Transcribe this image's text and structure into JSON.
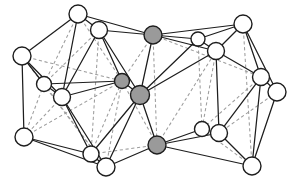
{
  "figure": {
    "kind": "node-link-diagram",
    "background_color": "#ffffff",
    "edge_solid_color": "#1d1d1d",
    "edge_dashed_color": "#9d9d9d",
    "node_white_fill": "#ffffff",
    "node_gray_fill": "#9a9a9a",
    "node_outline_color": "#1d1d1d",
    "node_count": 22,
    "gray_node_count": 4,
    "white_node_count": 18
  },
  "nodes": [
    {
      "id": "n1",
      "label": "",
      "x": 78,
      "y": 14,
      "r": 9.0,
      "fill": "white",
      "group": "left-cluster"
    },
    {
      "id": "n2",
      "label": "",
      "x": 99,
      "y": 30,
      "r": 8.5,
      "fill": "white",
      "group": "left-cluster"
    },
    {
      "id": "n3",
      "label": "",
      "x": 22,
      "y": 56,
      "r": 9.0,
      "fill": "white",
      "group": "left-cluster"
    },
    {
      "id": "n4",
      "label": "",
      "x": 44,
      "y": 84,
      "r": 7.5,
      "fill": "white",
      "group": "left-cluster"
    },
    {
      "id": "n5",
      "label": "",
      "x": 62,
      "y": 97,
      "r": 8.5,
      "fill": "white",
      "group": "left-cluster"
    },
    {
      "id": "n6",
      "label": "",
      "x": 24,
      "y": 137,
      "r": 9.0,
      "fill": "white",
      "group": "left-cluster"
    },
    {
      "id": "n7",
      "label": "",
      "x": 91,
      "y": 154,
      "r": 8.0,
      "fill": "white",
      "group": "left-cluster"
    },
    {
      "id": "n8",
      "label": "",
      "x": 106,
      "y": 167,
      "r": 9.0,
      "fill": "white",
      "group": "left-cluster"
    },
    {
      "id": "n9",
      "label": "",
      "x": 122,
      "y": 81,
      "r": 7.5,
      "fill": "gray",
      "group": "core"
    },
    {
      "id": "n10",
      "label": "",
      "x": 140,
      "y": 95,
      "r": 9.5,
      "fill": "gray",
      "group": "core"
    },
    {
      "id": "n11",
      "label": "",
      "x": 153,
      "y": 35,
      "r": 9.0,
      "fill": "gray",
      "group": "core"
    },
    {
      "id": "n12",
      "label": "",
      "x": 157,
      "y": 145,
      "r": 9.0,
      "fill": "gray",
      "group": "core"
    },
    {
      "id": "n13",
      "label": "",
      "x": 198,
      "y": 39,
      "r": 7.0,
      "fill": "white",
      "group": "right-cluster"
    },
    {
      "id": "n14",
      "label": "",
      "x": 216,
      "y": 51,
      "r": 8.5,
      "fill": "white",
      "group": "right-cluster"
    },
    {
      "id": "n15",
      "label": "",
      "x": 243,
      "y": 24,
      "r": 9.0,
      "fill": "white",
      "group": "right-cluster"
    },
    {
      "id": "n16",
      "label": "",
      "x": 261,
      "y": 77,
      "r": 8.5,
      "fill": "white",
      "group": "right-cluster"
    },
    {
      "id": "n17",
      "label": "",
      "x": 277,
      "y": 92,
      "r": 9.0,
      "fill": "white",
      "group": "right-cluster"
    },
    {
      "id": "n18",
      "label": "",
      "x": 202,
      "y": 129,
      "r": 7.5,
      "fill": "white",
      "group": "right-cluster"
    },
    {
      "id": "n19",
      "label": "",
      "x": 219,
      "y": 133,
      "r": 8.5,
      "fill": "white",
      "group": "right-cluster"
    },
    {
      "id": "n20",
      "label": "",
      "x": 252,
      "y": 166,
      "r": 9.0,
      "fill": "white",
      "group": "right-cluster"
    },
    {
      "id": "n21",
      "label": "",
      "x": 129,
      "y": 157,
      "r": 0.0,
      "fill": "white",
      "group": "hidden-helper"
    },
    {
      "id": "n22",
      "label": "",
      "x": 188,
      "y": 112,
      "r": 0.0,
      "fill": "white",
      "group": "hidden-helper"
    }
  ],
  "edges_solid": [
    [
      "n1",
      "n2"
    ],
    [
      "n1",
      "n3"
    ],
    [
      "n1",
      "n5"
    ],
    [
      "n1",
      "n11"
    ],
    [
      "n2",
      "n11"
    ],
    [
      "n2",
      "n5"
    ],
    [
      "n2",
      "n9"
    ],
    [
      "n2",
      "n10"
    ],
    [
      "n3",
      "n4"
    ],
    [
      "n3",
      "n5"
    ],
    [
      "n3",
      "n6"
    ],
    [
      "n4",
      "n5"
    ],
    [
      "n4",
      "n9"
    ],
    [
      "n5",
      "n9"
    ],
    [
      "n5",
      "n8"
    ],
    [
      "n5",
      "n7"
    ],
    [
      "n6",
      "n7"
    ],
    [
      "n6",
      "n8"
    ],
    [
      "n7",
      "n8"
    ],
    [
      "n7",
      "n10"
    ],
    [
      "n8",
      "n10"
    ],
    [
      "n8",
      "n12"
    ],
    [
      "n9",
      "n10"
    ],
    [
      "n10",
      "n11"
    ],
    [
      "n10",
      "n12"
    ],
    [
      "n10",
      "n14"
    ],
    [
      "n10",
      "n13"
    ],
    [
      "n11",
      "n13"
    ],
    [
      "n11",
      "n14"
    ],
    [
      "n11",
      "n15"
    ],
    [
      "n12",
      "n18"
    ],
    [
      "n12",
      "n19"
    ],
    [
      "n12",
      "n20"
    ],
    [
      "n13",
      "n14"
    ],
    [
      "n13",
      "n15"
    ],
    [
      "n14",
      "n15"
    ],
    [
      "n14",
      "n16"
    ],
    [
      "n14",
      "n19"
    ],
    [
      "n15",
      "n16"
    ],
    [
      "n15",
      "n17"
    ],
    [
      "n16",
      "n17"
    ],
    [
      "n16",
      "n19"
    ],
    [
      "n16",
      "n20"
    ],
    [
      "n17",
      "n20"
    ],
    [
      "n18",
      "n19"
    ],
    [
      "n19",
      "n20"
    ]
  ],
  "edges_dashed": [
    [
      "n1",
      "n4"
    ],
    [
      "n1",
      "n9"
    ],
    [
      "n2",
      "n4"
    ],
    [
      "n2",
      "n7"
    ],
    [
      "n3",
      "n9"
    ],
    [
      "n3",
      "n8"
    ],
    [
      "n4",
      "n6"
    ],
    [
      "n4",
      "n8"
    ],
    [
      "n5",
      "n6"
    ],
    [
      "n6",
      "n9"
    ],
    [
      "n7",
      "n9"
    ],
    [
      "n7",
      "n12"
    ],
    [
      "n8",
      "n9"
    ],
    [
      "n9",
      "n11"
    ],
    [
      "n9",
      "n12"
    ],
    [
      "n11",
      "n12"
    ],
    [
      "n11",
      "n16"
    ],
    [
      "n13",
      "n18"
    ],
    [
      "n14",
      "n18"
    ],
    [
      "n15",
      "n20"
    ],
    [
      "n16",
      "n18"
    ],
    [
      "n17",
      "n19"
    ],
    [
      "n18",
      "n20"
    ],
    [
      "n12",
      "n14"
    ]
  ]
}
